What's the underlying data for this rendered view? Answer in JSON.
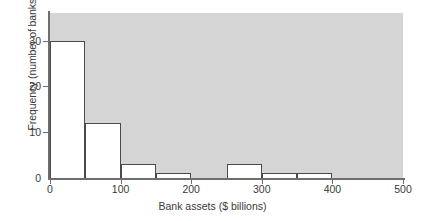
{
  "chart_data": {
    "type": "bar",
    "title": "",
    "subtitle": "",
    "xlabel": "Bank assets ($ billions)",
    "ylabel": "Frequency (number of banks)",
    "xlim": [
      0,
      500
    ],
    "ylim": [
      0,
      36
    ],
    "xticks": [
      0,
      100,
      200,
      300,
      400,
      500
    ],
    "xtick_labels": [
      "0",
      "100",
      "200",
      "300",
      "400",
      "500"
    ],
    "yticks": [
      0,
      10,
      20,
      30
    ],
    "ytick_labels": [
      "0",
      "10",
      "20",
      "30"
    ],
    "grid": false,
    "legend": null,
    "bin_width": 50,
    "bin_edges": [
      0,
      50,
      100,
      150,
      200,
      250,
      300,
      350,
      400,
      450,
      500
    ],
    "categories": [
      "0-50",
      "50-100",
      "100-150",
      "150-200",
      "200-250",
      "250-300",
      "300-350",
      "350-400",
      "400-450",
      "450-500"
    ],
    "values": [
      30,
      12,
      3,
      1,
      0,
      3,
      1,
      1,
      0,
      0
    ],
    "bars": [
      {
        "label": "0-50",
        "start": 0,
        "end": 50,
        "value": 30
      },
      {
        "label": "50-100",
        "start": 50,
        "end": 100,
        "value": 12
      },
      {
        "label": "100-150",
        "start": 100,
        "end": 150,
        "value": 3
      },
      {
        "label": "150-200",
        "start": 150,
        "end": 200,
        "value": 1
      },
      {
        "label": "200-250",
        "start": 200,
        "end": 250,
        "value": 0
      },
      {
        "label": "250-300",
        "start": 250,
        "end": 300,
        "value": 3
      },
      {
        "label": "300-350",
        "start": 300,
        "end": 350,
        "value": 1
      },
      {
        "label": "350-400",
        "start": 350,
        "end": 400,
        "value": 1
      },
      {
        "label": "400-450",
        "start": 400,
        "end": 450,
        "value": 0
      },
      {
        "label": "450-500",
        "start": 450,
        "end": 500,
        "value": 0
      }
    ],
    "colors": {
      "plot_background": "#d5d5d5",
      "figure_background": "#ffffff",
      "bar_fill": "#ffffff",
      "bar_edge": "#4a4a4a",
      "axis": "#6e6e6e",
      "text": "#3a3a3a"
    }
  }
}
